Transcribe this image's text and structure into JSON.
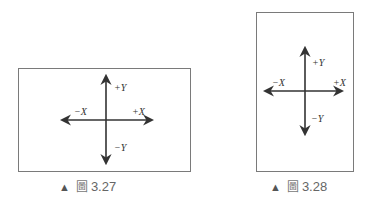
{
  "figures": [
    {
      "id": "fig-3-27",
      "orientation": "landscape",
      "labels": {
        "pos_y": "+Y",
        "neg_y": "−Y",
        "neg_x": "−X",
        "pos_x": "+X"
      },
      "caption": {
        "marker": "▲",
        "prefix": "圖",
        "number": "3.27"
      }
    },
    {
      "id": "fig-3-28",
      "orientation": "portrait",
      "labels": {
        "pos_y": "+Y",
        "neg_y": "−Y",
        "neg_x": "−X",
        "pos_x": "+X"
      },
      "caption": {
        "marker": "▲",
        "prefix": "圖",
        "number": "3.28"
      }
    }
  ],
  "colors": {
    "border": "#7a7a7a",
    "arrow": "#333333",
    "caption": "#666666"
  }
}
